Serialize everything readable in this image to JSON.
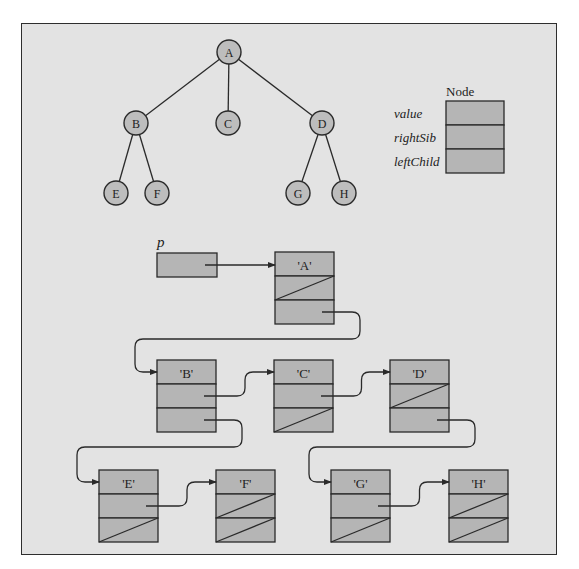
{
  "tree": {
    "nodes": [
      {
        "id": "A",
        "label": "A",
        "x": 229,
        "y": 52
      },
      {
        "id": "B",
        "label": "B",
        "x": 136,
        "y": 123
      },
      {
        "id": "C",
        "label": "C",
        "x": 228,
        "y": 123
      },
      {
        "id": "D",
        "label": "D",
        "x": 322,
        "y": 123
      },
      {
        "id": "E",
        "label": "E",
        "x": 116,
        "y": 193
      },
      {
        "id": "F",
        "label": "F",
        "x": 157,
        "y": 193
      },
      {
        "id": "G",
        "label": "G",
        "x": 298,
        "y": 193
      },
      {
        "id": "H",
        "label": "H",
        "x": 344,
        "y": 193
      }
    ],
    "edges": [
      [
        "A",
        "B"
      ],
      [
        "A",
        "C"
      ],
      [
        "A",
        "D"
      ],
      [
        "B",
        "E"
      ],
      [
        "B",
        "F"
      ],
      [
        "D",
        "G"
      ],
      [
        "D",
        "H"
      ]
    ]
  },
  "legend": {
    "title": "Node",
    "fields": [
      "value",
      "rightSib",
      "leftChild"
    ]
  },
  "pointer": {
    "label": "p"
  },
  "list_nodes": [
    {
      "id": "A",
      "value": "'A'",
      "x": 275,
      "y": 252,
      "rightSib": null,
      "leftChild": "B"
    },
    {
      "id": "B",
      "value": "'B'",
      "x": 157,
      "y": 360,
      "rightSib": "C",
      "leftChild": "E"
    },
    {
      "id": "C",
      "value": "'C'",
      "x": 274,
      "y": 360,
      "rightSib": "D",
      "leftChild": null
    },
    {
      "id": "D",
      "value": "'D'",
      "x": 390,
      "y": 360,
      "rightSib": null,
      "leftChild": "G"
    },
    {
      "id": "E",
      "value": "'E'",
      "x": 99,
      "y": 470,
      "rightSib": "F",
      "leftChild": null
    },
    {
      "id": "F",
      "value": "'F'",
      "x": 216,
      "y": 470,
      "rightSib": null,
      "leftChild": null
    },
    {
      "id": "G",
      "value": "'G'",
      "x": 331,
      "y": 470,
      "rightSib": "H",
      "leftChild": null
    },
    {
      "id": "H",
      "value": "'H'",
      "x": 449,
      "y": 470,
      "rightSib": null,
      "leftChild": null
    }
  ],
  "colors": {
    "background": "#e3e3e3",
    "cell_fill": "#b5b5b5",
    "circle_fill": "#bdbdbd",
    "stroke": "#2a2a2a"
  }
}
